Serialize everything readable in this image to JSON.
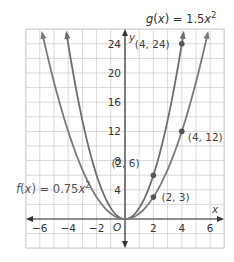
{
  "chart_data": {
    "type": "line",
    "title": "",
    "xlabel": "x",
    "ylabel": "y",
    "origin_label": "O",
    "xlim": [
      -7,
      7
    ],
    "ylim": [
      -4,
      26
    ],
    "grid": true,
    "x_ticks": [
      -6,
      -4,
      -2,
      2,
      4,
      6
    ],
    "x_tick_labels": [
      "−6",
      "−4",
      "−2",
      "2",
      "4",
      "6"
    ],
    "y_ticks": [
      4,
      8,
      12,
      16,
      20,
      24
    ],
    "y_tick_labels": [
      "4",
      "8",
      "12",
      "16",
      "20",
      "24"
    ],
    "series": [
      {
        "name": "g(x) = 1.5x^2",
        "label_parts": {
          "fn": "g",
          "var": "x",
          "coef": "1.5",
          "exp": "2"
        },
        "coefficient": 1.5,
        "color": "#6e6e6e",
        "points": [
          {
            "x": 2,
            "y": 6,
            "label": "(2, 6)"
          },
          {
            "x": 4,
            "y": 24,
            "label": "(4, 24)"
          }
        ]
      },
      {
        "name": "f(x) = 0.75x^2",
        "label_parts": {
          "fn": "f",
          "var": "x",
          "coef": "0.75",
          "exp": "2"
        },
        "coefficient": 0.75,
        "color": "#7a7a7a",
        "points": [
          {
            "x": 2,
            "y": 3,
            "label": "(2, 3)"
          },
          {
            "x": 4,
            "y": 12,
            "label": "(4, 12)"
          }
        ]
      }
    ],
    "colors": {
      "grid": "#cfcfcf",
      "axis": "#333333",
      "point": "#555555"
    }
  }
}
